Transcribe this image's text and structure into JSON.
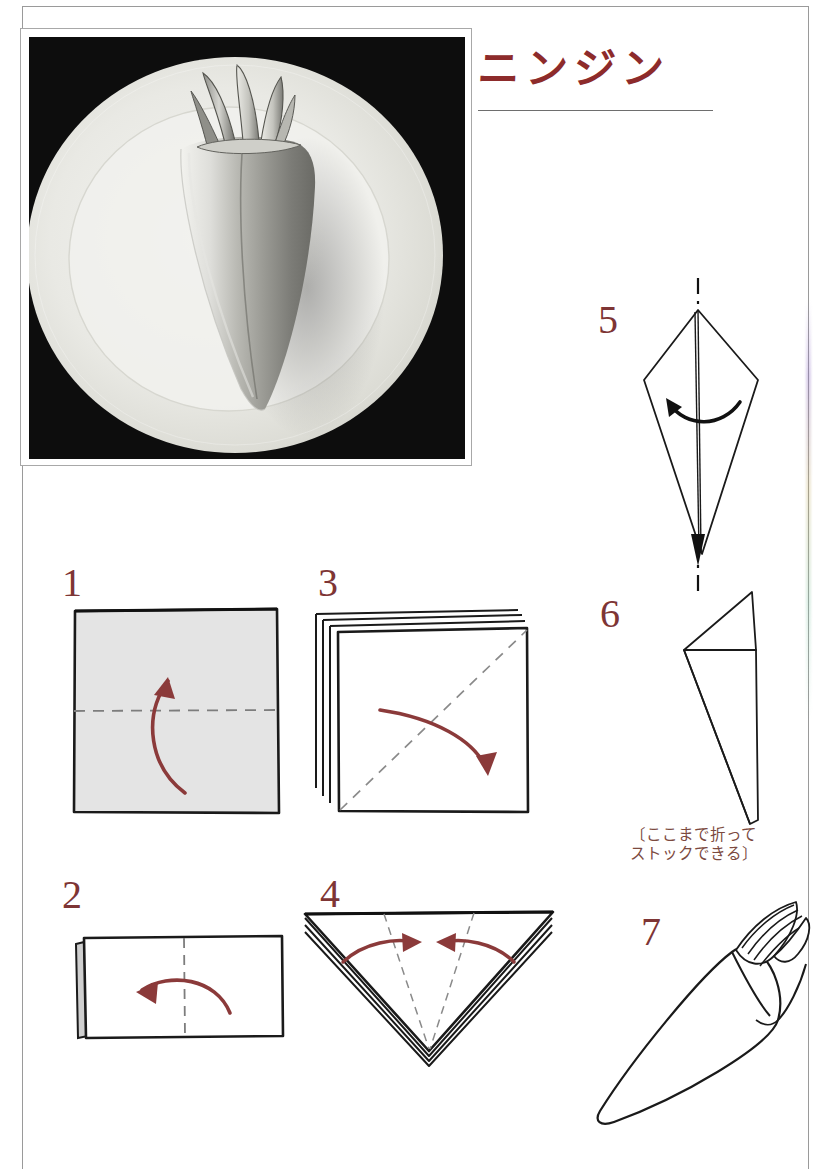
{
  "page": {
    "title": "ニンジン",
    "title_romaji_meaning": "Carrot",
    "background_color": "#ffffff",
    "border_color": "#9a9a9a",
    "accent_color": "#8d2b2b",
    "step_number_color": "#7e3535",
    "arrow_color": "#8b3a3a",
    "fold_line_color": "#8a8a8a"
  },
  "photo": {
    "name": "carrot-napkin-fold-photo",
    "description": "黒背景に白い皿、ニンジン形に折ったナプキン",
    "background_color": "#0d0d0d",
    "plate_color": "#ededea"
  },
  "steps": [
    {
      "number": "1",
      "name": "step-1",
      "shape": "square-with-horizontal-fold",
      "arrow": "curve-up",
      "fill": "#e3e3e3"
    },
    {
      "number": "2",
      "name": "step-2",
      "shape": "rectangle-with-vertical-fold",
      "arrow": "curve-left",
      "fill": "#ffffff"
    },
    {
      "number": "3",
      "name": "step-3",
      "shape": "stacked-square-with-diagonal-fold",
      "arrow": "curve-down-right",
      "fill": "#ffffff"
    },
    {
      "number": "4",
      "name": "step-4",
      "shape": "layered-triangle-with-two-folds",
      "arrow": "two-arrows-inward",
      "fill": "#ffffff"
    },
    {
      "number": "5",
      "name": "step-5",
      "shape": "kite-with-center-axis",
      "arrow": "flip-over",
      "fill": "#ffffff"
    },
    {
      "number": "6",
      "name": "step-6",
      "shape": "cone-with-top-flap",
      "arrow": "none",
      "fill": "#ffffff"
    },
    {
      "number": "7",
      "name": "step-7",
      "shape": "finished-carrot",
      "arrow": "none",
      "fill": "#ffffff"
    }
  ],
  "caption": {
    "name": "stock-note",
    "line1": "〔ここまで折って",
    "line2": "ストックできる〕",
    "color": "#7c4a3f"
  }
}
